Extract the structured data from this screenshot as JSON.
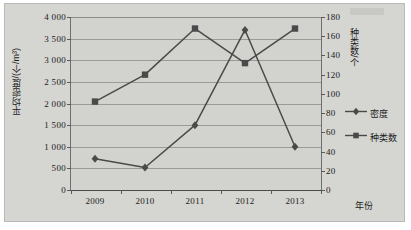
{
  "chart_data": {
    "type": "line",
    "title": "",
    "subtitle": "",
    "xlabel": "年份",
    "ylabel": "平均密度/(个/m³)",
    "y2label": "种类数/个",
    "categories": [
      "2009",
      "2010",
      "2011",
      "2012",
      "2013"
    ],
    "series": [
      {
        "name": "密度",
        "axis": "left",
        "marker": "diamond",
        "color": "#4a4a4a",
        "values": [
          720,
          520,
          1500,
          3700,
          1000
        ]
      },
      {
        "name": "种类数",
        "axis": "right",
        "marker": "square",
        "color": "#4a4a4a",
        "values": [
          92,
          120,
          168,
          132,
          168
        ]
      }
    ],
    "ylim": [
      0,
      4000
    ],
    "y2lim": [
      0,
      180
    ],
    "yticks": [
      0,
      500,
      1000,
      1500,
      2000,
      2500,
      3000,
      3500,
      4000
    ],
    "ytick_labels": [
      "0",
      "500",
      "1 000",
      "1 500",
      "2 000",
      "2 500",
      "3 000",
      "3 500",
      "4 000"
    ],
    "y2ticks": [
      0,
      20,
      40,
      60,
      80,
      100,
      120,
      140,
      160,
      180
    ],
    "y2tick_labels": [
      "0",
      "20",
      "40",
      "60",
      "80",
      "100",
      "120",
      "140",
      "160",
      "180"
    ],
    "grid": true,
    "grid_axis": "y",
    "legend_position": "right",
    "legend": [
      "密度",
      "种类数"
    ],
    "plot_background": "#d2d2ce",
    "grid_color": "#9a9a96",
    "axis_color": "#4a4a4a"
  },
  "legend_items": [
    {
      "label": "密度",
      "marker": "diamond-marker-icon"
    },
    {
      "label": "种类数",
      "marker": "square-marker-icon"
    }
  ]
}
